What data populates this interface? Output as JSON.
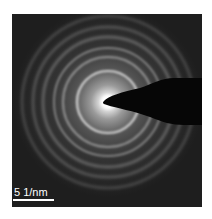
{
  "figure": {
    "type": "selected-area electron diffraction pattern",
    "scale_bar": {
      "label": "5 1/nm"
    },
    "rings": [
      {
        "radius_px": 31,
        "intensity": 0.85
      },
      {
        "radius_px": 45,
        "intensity": 0.55
      },
      {
        "radius_px": 54,
        "intensity": 0.5
      },
      {
        "radius_px": 65,
        "intensity": 0.42
      },
      {
        "radius_px": 75,
        "intensity": 0.35
      },
      {
        "radius_px": 86,
        "intensity": 0.28
      }
    ],
    "colors": {
      "background": "#1e1e1e",
      "ring": "#d8d8d8",
      "beam_stop": "#050505",
      "center_glow": "#ffffff"
    }
  }
}
